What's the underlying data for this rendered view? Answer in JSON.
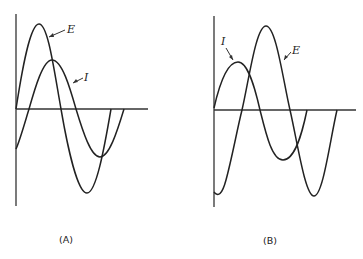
{
  "panels": [
    {
      "caption": "(A)",
      "curves": [
        {
          "label": "E",
          "description": "voltage wave, larger amplitude, leads"
        },
        {
          "label": "I",
          "description": "current wave, smaller amplitude, lags E"
        }
      ]
    },
    {
      "caption": "(B)",
      "curves": [
        {
          "label": "I",
          "description": "current wave, smaller amplitude, leads"
        },
        {
          "label": "E",
          "description": "voltage wave, larger amplitude, lags I"
        }
      ]
    }
  ],
  "colors": {
    "line": "#222222",
    "background": "#ffffff"
  }
}
